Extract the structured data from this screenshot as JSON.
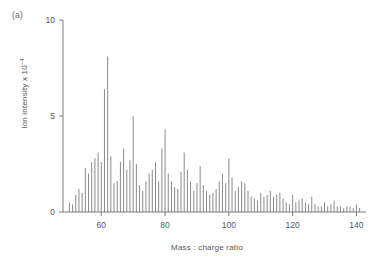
{
  "panel": {
    "label": "(a)"
  },
  "axes": {
    "x_title": "Mass : charge ratio",
    "y_title_main": "Ion intensity x 10",
    "y_title_exponent": "−4",
    "x_ticks": [
      "60",
      "80",
      "100",
      "120",
      "140"
    ],
    "y_ticks": [
      "0",
      "5",
      "10"
    ]
  },
  "style": {
    "line_color": "#8a8a8c",
    "axis_color": "#6e6e70",
    "text_color": "#58585a",
    "background": "#ffffff"
  },
  "chart_data": {
    "type": "bar",
    "title": "",
    "subtitle": "",
    "xlabel": "Mass : charge ratio",
    "ylabel": "Ion intensity x 10^-4",
    "xlim": [
      48,
      143
    ],
    "ylim": [
      0,
      10
    ],
    "xticks": [
      60,
      80,
      100,
      120,
      140
    ],
    "yticks": [
      0,
      5,
      10
    ],
    "grid": false,
    "legend": null,
    "annotations": [
      "(a)"
    ],
    "x": [
      50,
      51,
      52,
      53,
      54,
      55,
      56,
      57,
      58,
      59,
      60,
      61,
      62,
      63,
      64,
      65,
      66,
      67,
      68,
      69,
      70,
      71,
      72,
      73,
      74,
      75,
      76,
      77,
      78,
      79,
      80,
      81,
      82,
      83,
      84,
      85,
      86,
      87,
      88,
      89,
      90,
      91,
      92,
      93,
      94,
      95,
      96,
      97,
      98,
      99,
      100,
      101,
      102,
      103,
      104,
      105,
      106,
      107,
      108,
      109,
      110,
      111,
      112,
      113,
      114,
      115,
      116,
      117,
      118,
      119,
      120,
      121,
      122,
      123,
      124,
      125,
      126,
      127,
      128,
      129,
      130,
      131,
      132,
      133,
      134,
      135,
      136,
      137,
      138,
      139,
      140,
      141
    ],
    "values": [
      0.5,
      0.4,
      0.9,
      1.2,
      1.0,
      2.3,
      2.0,
      2.6,
      2.8,
      3.1,
      2.6,
      6.4,
      8.1,
      2.9,
      1.5,
      1.6,
      2.6,
      3.3,
      2.2,
      2.7,
      5.0,
      2.5,
      1.4,
      1.1,
      1.6,
      2.0,
      2.2,
      2.6,
      1.6,
      3.3,
      4.3,
      2.0,
      1.6,
      1.3,
      1.2,
      2.1,
      3.1,
      2.2,
      1.6,
      1.1,
      1.5,
      2.4,
      1.4,
      1.1,
      0.9,
      1.0,
      1.2,
      1.6,
      2.0,
      1.5,
      2.8,
      1.8,
      1.1,
      1.3,
      1.6,
      1.5,
      1.1,
      0.8,
      0.7,
      0.6,
      1.0,
      0.8,
      0.9,
      1.1,
      0.8,
      0.9,
      1.0,
      0.7,
      0.5,
      0.4,
      0.9,
      0.5,
      0.6,
      0.7,
      0.5,
      0.4,
      0.8,
      0.4,
      0.3,
      0.3,
      0.5,
      0.3,
      0.4,
      0.6,
      0.3,
      0.3,
      0.2,
      0.3,
      0.3,
      0.2,
      0.4,
      0.2
    ]
  }
}
